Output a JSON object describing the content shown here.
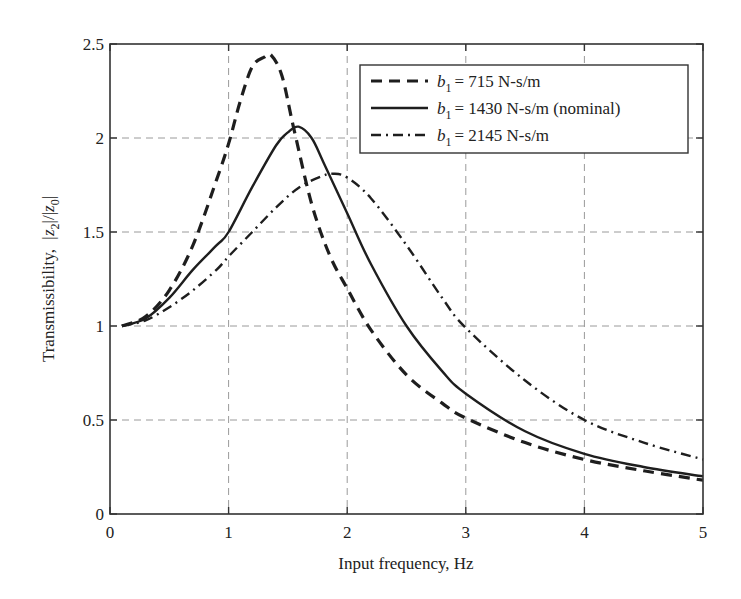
{
  "chart_data": {
    "type": "line",
    "title": "",
    "xlabel": "Input frequency, Hz",
    "ylabel_prefix": "Transmissibility,",
    "ylabel_expr": "|z2|/|z0|",
    "xlim": [
      0,
      5
    ],
    "ylim": [
      0,
      2.5
    ],
    "xticks": [
      0,
      1,
      2,
      3,
      4,
      5
    ],
    "yticks": [
      0,
      0.5,
      1,
      1.5,
      2,
      2.5
    ],
    "xtick_labels": [
      "0",
      "1",
      "2",
      "3",
      "4",
      "5"
    ],
    "ytick_labels": [
      "0",
      "0.5",
      "1",
      "1.5",
      "2",
      "2.5"
    ],
    "grid": true,
    "legend_position": "upper right",
    "series": [
      {
        "name": "b1 = 715 N-s/m",
        "legend_label": "= 715 N-s/m",
        "style": "dashed",
        "x": [
          0.1,
          0.3,
          0.5,
          0.7,
          0.9,
          1.0,
          1.1,
          1.2,
          1.3,
          1.36,
          1.45,
          1.55,
          1.7,
          1.85,
          2.0,
          2.2,
          2.5,
          2.8,
          3.0,
          3.5,
          4.0,
          4.5,
          5.0
        ],
        "values": [
          1.0,
          1.05,
          1.19,
          1.43,
          1.78,
          1.97,
          2.2,
          2.38,
          2.43,
          2.44,
          2.33,
          2.05,
          1.65,
          1.38,
          1.2,
          0.98,
          0.74,
          0.59,
          0.51,
          0.38,
          0.29,
          0.23,
          0.18
        ]
      },
      {
        "name": "b1 = 1430 N-s/m (nominal)",
        "legend_label": "= 1430 N-s/m (nominal)",
        "style": "solid",
        "x": [
          0.1,
          0.3,
          0.5,
          0.7,
          0.9,
          1.0,
          1.2,
          1.4,
          1.5,
          1.59,
          1.7,
          1.8,
          2.0,
          2.2,
          2.5,
          2.8,
          3.0,
          3.5,
          4.0,
          4.5,
          5.0
        ],
        "values": [
          1.0,
          1.04,
          1.15,
          1.3,
          1.43,
          1.5,
          1.74,
          1.96,
          2.03,
          2.06,
          2.0,
          1.87,
          1.6,
          1.33,
          1.0,
          0.76,
          0.64,
          0.44,
          0.32,
          0.25,
          0.2
        ]
      },
      {
        "name": "b1 = 2145 N-s/m",
        "legend_label": "= 2145 N-s/m",
        "style": "dashdot",
        "x": [
          0.1,
          0.3,
          0.5,
          0.7,
          0.9,
          1.0,
          1.2,
          1.4,
          1.6,
          1.8,
          1.88,
          2.0,
          2.2,
          2.5,
          2.8,
          3.0,
          3.5,
          4.0,
          4.5,
          5.0
        ],
        "values": [
          1.0,
          1.03,
          1.1,
          1.19,
          1.3,
          1.37,
          1.5,
          1.63,
          1.74,
          1.8,
          1.81,
          1.79,
          1.68,
          1.43,
          1.15,
          0.99,
          0.71,
          0.5,
          0.38,
          0.29
        ]
      }
    ]
  },
  "legend": {
    "var_name": "b",
    "var_sub": "1",
    "items": [
      "= 715 N-s/m",
      "= 1430 N-s/m (nominal)",
      "= 2145 N-s/m"
    ]
  },
  "colors": {
    "line": "#1e1e1e",
    "grid": "#9a9a9a",
    "axes": "#333333"
  }
}
